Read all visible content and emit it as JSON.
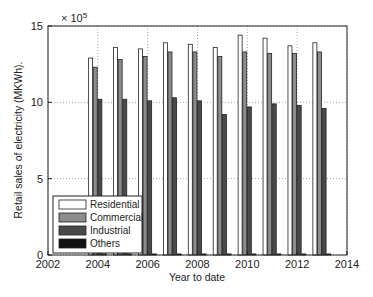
{
  "chart_data": {
    "type": "bar",
    "title": "",
    "xlabel": "Year to date",
    "ylabel": "Retail sales of electricity (MKWh).",
    "y_multiplier": "× 10^5",
    "y_multiplier_base": "× 10",
    "y_multiplier_exp": "5",
    "xlim": [
      2002,
      2014
    ],
    "ylim": [
      0,
      15
    ],
    "x_ticks": [
      "2002",
      "2004",
      "2006",
      "2008",
      "2010",
      "2012",
      "2014"
    ],
    "y_ticks": [
      "0",
      "5",
      "10",
      "15"
    ],
    "grid": true,
    "legend_position": "lower left",
    "categories": [
      2004,
      2005,
      2006,
      2007,
      2008,
      2009,
      2010,
      2011,
      2012,
      2013
    ],
    "series": [
      {
        "name": "Residential",
        "color": "#ffffff",
        "values": [
          12.9,
          13.6,
          13.5,
          13.9,
          13.8,
          13.6,
          14.4,
          14.2,
          13.7,
          13.9
        ]
      },
      {
        "name": "Commercial",
        "color": "#8c8c8c",
        "values": [
          12.3,
          12.8,
          13.0,
          13.3,
          13.3,
          13.0,
          13.3,
          13.2,
          13.2,
          13.3
        ]
      },
      {
        "name": "Industrial",
        "color": "#4a4a4a",
        "values": [
          10.2,
          10.2,
          10.1,
          10.3,
          10.1,
          9.2,
          9.7,
          9.9,
          9.8,
          9.6
        ]
      },
      {
        "name": "Others",
        "color": "#111111",
        "values": [
          0.07,
          0.07,
          0.07,
          0.07,
          0.07,
          0.07,
          0.07,
          0.07,
          0.07,
          0.07
        ]
      }
    ]
  }
}
